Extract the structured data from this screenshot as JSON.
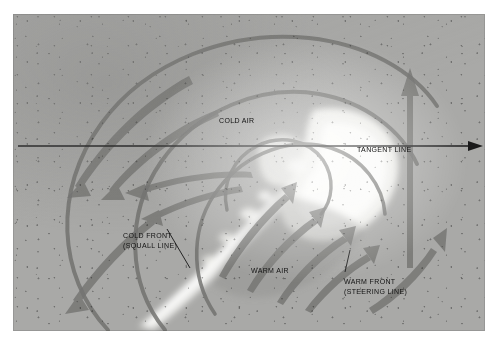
{
  "image": {
    "kind": "satellite-photograph",
    "subject": "extratropical cyclone comma cloud with overlaid frontal analysis",
    "palette": {
      "paper": "#ffffff",
      "photo_base": "#a9a9a7",
      "cloud_white": "#f2f2ef",
      "arc_overlay": "#6f6f6d",
      "arrow_overlay": "#737371",
      "annotation_text": "#121212",
      "tangent_line": "#1a1a1a"
    },
    "frame": {
      "left": 13,
      "top": 14,
      "width": 472,
      "height": 317
    }
  },
  "annotations": {
    "cold_air": {
      "text": "COLD AIR",
      "x": 219,
      "y": 104
    },
    "tangent_line": {
      "text": "TANGENT LINE",
      "x": 357,
      "y": 133
    },
    "cold_front": {
      "line1": "COLD FRONT",
      "line2": "(SQUALL LINE)",
      "x": 123,
      "y": 219
    },
    "warm_air": {
      "text": "WARM AIR",
      "x": 251,
      "y": 254
    },
    "warm_front": {
      "line1": "WARM FRONT",
      "line2": "(STEERING LINE)",
      "x": 344,
      "y": 265
    }
  },
  "overlay": {
    "tangent_axis": {
      "name": "tangent-line",
      "y": 146,
      "x_start": 18,
      "x_end": 476,
      "has_arrowhead": true,
      "arrow_direction": "right"
    },
    "spiral_arcs": [
      {
        "name": "outer-arc",
        "stroke_width": 4.0
      },
      {
        "name": "second-arc",
        "stroke_width": 4.0
      },
      {
        "name": "third-arc",
        "stroke_width": 3.6
      },
      {
        "name": "inner-arc",
        "stroke_width": 3.4
      }
    ],
    "flow_arrows": [
      {
        "name": "cold-flow-arrow-1",
        "region": "cold-air",
        "direction": "down-left"
      },
      {
        "name": "cold-flow-arrow-2",
        "region": "cold-air",
        "direction": "down-left"
      },
      {
        "name": "cold-flow-arrow-3",
        "region": "cold-air",
        "direction": "left"
      },
      {
        "name": "cold-flow-arrow-4",
        "region": "cold-air",
        "direction": "left"
      },
      {
        "name": "cold-flow-arrow-5",
        "region": "cold-air",
        "direction": "down-left"
      },
      {
        "name": "warm-flow-arrow-1",
        "region": "warm-air",
        "direction": "up-right"
      },
      {
        "name": "warm-flow-arrow-2",
        "region": "warm-air",
        "direction": "up-right"
      },
      {
        "name": "warm-flow-arrow-3",
        "region": "warm-air",
        "direction": "up-right"
      },
      {
        "name": "warm-flow-arrow-4",
        "region": "warm-air",
        "direction": "up-right"
      },
      {
        "name": "warm-flow-arrow-5",
        "region": "warm-sector-right",
        "direction": "up"
      },
      {
        "name": "warm-flow-arrow-6",
        "region": "warm-sector-right",
        "direction": "up-right"
      }
    ],
    "leader_lines": [
      {
        "name": "cold-front-leader",
        "from": "cold-front-label",
        "to": "squall-line-cloud"
      },
      {
        "name": "warm-front-leader",
        "from": "warm-front-label",
        "to": "steering-line-cloud"
      }
    ]
  }
}
